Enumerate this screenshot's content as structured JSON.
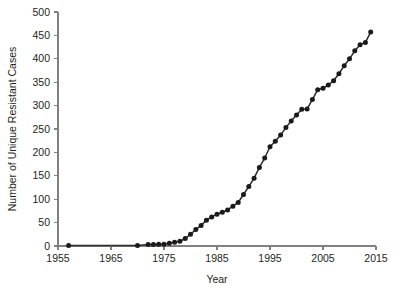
{
  "chart_data": {
    "type": "line",
    "title": "",
    "xlabel": "Year",
    "ylabel": "Number of Unique Resistant Cases",
    "xlim": [
      1955,
      2015
    ],
    "ylim": [
      0,
      500
    ],
    "xticks": [
      1955,
      1965,
      1975,
      1985,
      1995,
      2005,
      2015
    ],
    "yticks": [
      0,
      50,
      100,
      150,
      200,
      250,
      300,
      350,
      400,
      450,
      500
    ],
    "grid": false,
    "legend": null,
    "marker": "circle",
    "line_color": "#2b2b2b",
    "marker_color": "#1a1a1a",
    "axis_color": "#808080",
    "background": "#ffffff",
    "series": [
      {
        "name": "Unique resistant cases (cumulative)",
        "x": [
          1957,
          1970,
          1972,
          1973,
          1974,
          1975,
          1976,
          1977,
          1978,
          1979,
          1980,
          1981,
          1982,
          1983,
          1984,
          1985,
          1986,
          1987,
          1988,
          1989,
          1990,
          1991,
          1992,
          1993,
          1994,
          1995,
          1996,
          1997,
          1998,
          1999,
          2000,
          2001,
          2002,
          2003,
          2004,
          2005,
          2006,
          2007,
          2008,
          2009,
          2010,
          2011,
          2012,
          2013,
          2014
        ],
        "y": [
          1,
          1,
          3,
          3,
          4,
          4,
          6,
          8,
          10,
          16,
          25,
          35,
          44,
          55,
          62,
          68,
          72,
          77,
          85,
          93,
          110,
          127,
          145,
          168,
          188,
          212,
          224,
          237,
          253,
          267,
          280,
          292,
          293,
          313,
          334,
          337,
          344,
          353,
          368,
          385,
          400,
          417,
          430,
          435,
          457
        ]
      }
    ]
  },
  "layout": {
    "plot_left": 58,
    "plot_right": 376,
    "plot_top": 12,
    "plot_bottom": 246
  }
}
